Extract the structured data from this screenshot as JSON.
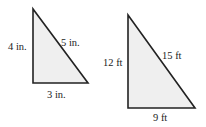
{
  "diagram": {
    "type": "similar-right-triangles",
    "colors": {
      "stroke": "#222222",
      "fill": "#efefef",
      "text": "#222222"
    },
    "triangles": [
      {
        "id": "small",
        "unit": "in.",
        "vertices": {
          "top": [
            33,
            9
          ],
          "right_angle": [
            33,
            83
          ],
          "base_end": [
            88,
            83
          ]
        },
        "labels": {
          "vertical_leg": "4 in.",
          "hypotenuse": "5 in.",
          "horizontal_leg": "3 in."
        }
      },
      {
        "id": "large",
        "unit": "ft",
        "vertices": {
          "top": [
            128,
            15
          ],
          "right_angle": [
            128,
            108
          ],
          "base_end": [
            195,
            108
          ]
        },
        "labels": {
          "vertical_leg": "12 ft",
          "hypotenuse": "15 ft",
          "horizontal_leg": "9 ft"
        }
      }
    ]
  }
}
